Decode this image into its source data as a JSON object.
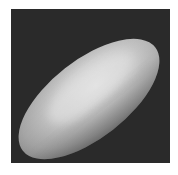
{
  "image": {
    "description": "Grayscale rendering of a smooth ellipsoid (pill/egg-shaped object) tilted diagonally on a dark background",
    "subject": "ellipsoid",
    "colors": {
      "background": "#2a2a2a",
      "page": "#ffffff",
      "highlight": "#e2e2e2",
      "midtone": "#b8b8b8",
      "shadow": "#7a7a7a"
    }
  }
}
